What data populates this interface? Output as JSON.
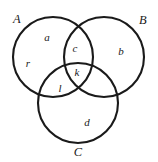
{
  "figure": {
    "name": "three-set-venn-diagram",
    "background_color": "#ffffff",
    "stroke_color": "#1a1a1a",
    "text_color": "#1a1a1a",
    "stroke_width": 2.1
  },
  "sets": [
    {
      "id": "A",
      "label": "A",
      "label_x": 17,
      "label_y": 19,
      "cx": 53,
      "cy": 57,
      "r": 40
    },
    {
      "id": "B",
      "label": "B",
      "label_x": 143,
      "label_y": 20,
      "cx": 104,
      "cy": 57,
      "r": 40
    },
    {
      "id": "C",
      "label": "C",
      "label_x": 78,
      "label_y": 152,
      "cx": 78,
      "cy": 103,
      "r": 40
    }
  ],
  "regions": [
    {
      "id": "a",
      "label": "a",
      "region": "A-only-upper",
      "x": 47,
      "y": 37
    },
    {
      "id": "r",
      "label": "r",
      "region": "A-only-left",
      "x": 28,
      "y": 63
    },
    {
      "id": "b",
      "label": "b",
      "region": "B-only",
      "x": 121,
      "y": 51
    },
    {
      "id": "c",
      "label": "c",
      "region": "A-and-B-only",
      "x": 75,
      "y": 48
    },
    {
      "id": "k",
      "label": "k",
      "region": "A-and-B-and-C",
      "x": 77,
      "y": 72
    },
    {
      "id": "l",
      "label": "l",
      "region": "A-and-C-only",
      "x": 60,
      "y": 88
    },
    {
      "id": "d",
      "label": "d",
      "region": "C-only",
      "x": 87,
      "y": 122
    }
  ]
}
